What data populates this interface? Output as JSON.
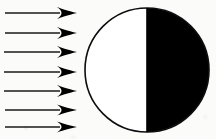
{
  "figure": {
    "background_color": "#fbfbfa",
    "ink_color": "#0d0d0d",
    "caption": ""
  },
  "rays": {
    "label": "incoming parallel light rays",
    "count": 7,
    "direction": "left-to-right",
    "shaft_color": "#1a1a1a",
    "head_color": "#000000",
    "items": [
      {
        "name": "ray-1",
        "x_start": 5,
        "x_tip": 77,
        "y": 13,
        "shaft_thickness": 1.6,
        "head_length": 20,
        "head_half_height": 6.0
      },
      {
        "name": "ray-2",
        "x_start": 5,
        "x_tip": 77,
        "y": 33,
        "shaft_thickness": 1.6,
        "head_length": 20,
        "head_half_height": 6.0
      },
      {
        "name": "ray-3",
        "x_start": 4,
        "x_tip": 77,
        "y": 52,
        "shaft_thickness": 1.5,
        "head_length": 20,
        "head_half_height": 6.0
      },
      {
        "name": "ray-4",
        "x_start": 4,
        "x_tip": 77,
        "y": 72,
        "shaft_thickness": 1.5,
        "head_length": 20,
        "head_half_height": 6.0
      },
      {
        "name": "ray-5",
        "x_start": 4,
        "x_tip": 77,
        "y": 91,
        "shaft_thickness": 1.6,
        "head_length": 20,
        "head_half_height": 6.0
      },
      {
        "name": "ray-6",
        "x_start": 5,
        "x_tip": 77,
        "y": 110,
        "shaft_thickness": 1.5,
        "head_length": 20,
        "head_half_height": 5.6
      },
      {
        "name": "ray-7",
        "x_start": 5,
        "x_tip": 77,
        "y": 127,
        "shaft_thickness": 1.5,
        "head_length": 20,
        "head_half_height": 5.4
      }
    ]
  },
  "sphere": {
    "label": "sphere with half lit and half shadowed",
    "center_x": 147,
    "center_y": 70,
    "radius": 62,
    "outline_color": "#0d0d0d",
    "outline_width": 1.6,
    "lit_half": {
      "name": "illuminated-hemisphere",
      "side": "left",
      "fill_color": "#ffffff"
    },
    "dark_half": {
      "name": "shadowed-hemisphere",
      "side": "right",
      "fill_color": "#000000"
    },
    "terminator": {
      "name": "terminator-line",
      "x": 147,
      "color": "#000000",
      "width": 1.6
    }
  }
}
